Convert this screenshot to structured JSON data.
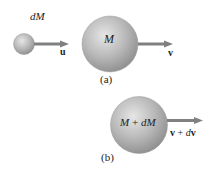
{
  "diagram": {
    "colors": {
      "sphere_light": "#e0e0e0",
      "sphere_mid": "#b4b4b4",
      "sphere_dark": "#8a8a8a",
      "arrow": "#7a7a7a",
      "text": "#222222"
    },
    "panel_a": {
      "caption": "(a)",
      "small_mass": {
        "label": "dM",
        "velocity_label": "u"
      },
      "large_mass": {
        "label": "M",
        "velocity_label": "v"
      }
    },
    "panel_b": {
      "caption": "(b)",
      "combined_mass": {
        "label_M": "M",
        "label_plus": "+",
        "label_dM": "dM"
      },
      "velocity": {
        "v": "v",
        "plus": "+",
        "d": "d",
        "v2": "v"
      }
    }
  }
}
